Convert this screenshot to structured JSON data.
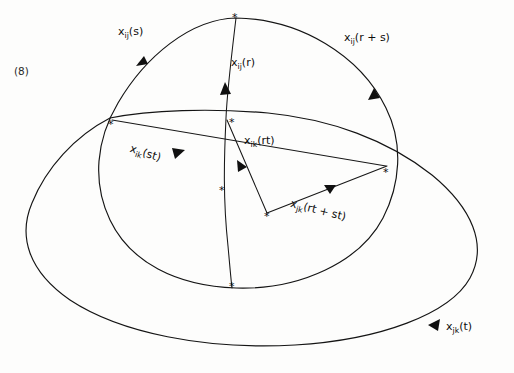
{
  "figure": {
    "equation_number": "(8)",
    "background_color": "#fdfdfc",
    "ink_color": "#141414",
    "vertex_marker": "*",
    "vertex_markers": [
      {
        "name": "top-pole-vertex",
        "x": 236,
        "y": 19
      },
      {
        "name": "left-intersection-vertex",
        "x": 111,
        "y": 119
      },
      {
        "name": "upper-center-vertex",
        "x": 226,
        "y": 118
      },
      {
        "name": "right-intersection-vertex",
        "x": 387,
        "y": 168
      },
      {
        "name": "mid-left-cross-vertex",
        "x": 223,
        "y": 187
      },
      {
        "name": "lower-center-vertex",
        "x": 268,
        "y": 214
      },
      {
        "name": "bottom-pole-vertex",
        "x": 232,
        "y": 288
      }
    ],
    "labels": [
      {
        "id": "x_ij_s",
        "base": "x",
        "sub": "ij",
        "arg": "(s)",
        "text": "x_ij(s)"
      },
      {
        "id": "x_ij_r",
        "base": "x",
        "sub": "ij",
        "arg": "(r)",
        "text": "x_ij(r)"
      },
      {
        "id": "x_ij_rs",
        "base": "x",
        "sub": "ij",
        "arg": "(r + s)",
        "text": "x_ij(r + s)"
      },
      {
        "id": "x_ik_st",
        "base": "x",
        "sub": "ik",
        "arg": "(st)",
        "text": "x_ik(st)"
      },
      {
        "id": "x_ik_rt",
        "base": "x",
        "sub": "ik",
        "arg": "(rt)",
        "text": "x_ik(rt)"
      },
      {
        "id": "x_jk_rtst",
        "base": "x",
        "sub": "jk",
        "arg": "(rt + st)",
        "text": "x_jk(rt + st)"
      },
      {
        "id": "x_jk_t",
        "base": "x",
        "sub": "jk",
        "arg": "(t)",
        "text": "x_jk(t)"
      }
    ]
  }
}
